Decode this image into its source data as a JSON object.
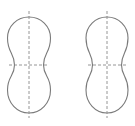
{
  "diagram": {
    "type": "peanut-shape-outlines-with-symmetry-axes",
    "background": "#ffffff",
    "stroke_color": "#7a7a7a",
    "axis_color": "#8a8a8a",
    "shapes": [
      {
        "id": "left",
        "center_x": 29,
        "top_y": 17,
        "bottom_y": 113,
        "waist_y": 65,
        "lobe_half_width": 21.5,
        "waist_half_width": 14.5,
        "upper_lobe_y": 38,
        "lower_lobe_y": 90,
        "vertical_axis": {
          "y1": 11,
          "y2": 118
        },
        "horizontal_axis": {
          "x1": 9,
          "x2": 49
        }
      },
      {
        "id": "right",
        "center_x": 107,
        "top_y": 17,
        "bottom_y": 113,
        "waist_y": 65,
        "lobe_half_width": 21,
        "waist_half_width": 14.5,
        "upper_lobe_y": 38,
        "lower_lobe_y": 90,
        "vertical_axis": {
          "y1": 11,
          "y2": 118
        },
        "horizontal_axis": {
          "x1": 88,
          "x2": 126
        }
      }
    ]
  }
}
